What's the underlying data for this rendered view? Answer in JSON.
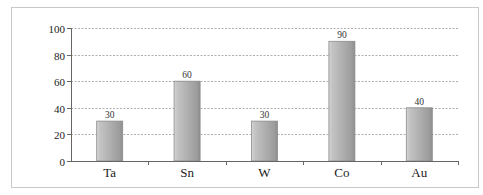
{
  "chart_data": {
    "type": "bar",
    "title": "",
    "xlabel": "",
    "ylabel": "",
    "categories": [
      "Ta",
      "Sn",
      "W",
      "Co",
      "Au"
    ],
    "values": [
      30,
      60,
      30,
      90,
      40
    ],
    "data_labels": [
      "30",
      "60",
      "30",
      "90",
      "40"
    ],
    "ylim": [
      0,
      100
    ],
    "yticks": [
      0,
      20,
      40,
      60,
      80,
      100
    ],
    "ytick_labels": [
      "0",
      "20",
      "40",
      "60",
      "80",
      "100"
    ],
    "grid": true,
    "grid_style": "dashed",
    "legend": null,
    "bar_color": "#a9a9a9",
    "bar_edge_color": "#8a8a8a"
  }
}
